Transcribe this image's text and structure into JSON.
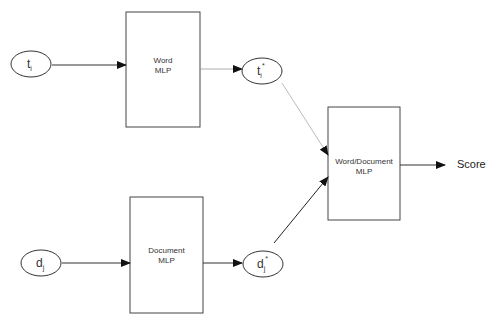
{
  "diagram": {
    "nodes": {
      "t_i": {
        "base": "t",
        "sub": "i",
        "sup": ""
      },
      "t_i_star": {
        "base": "t",
        "sub": "i",
        "sup": "*"
      },
      "d_j": {
        "base": "d",
        "sub": "j",
        "sup": ""
      },
      "d_j_star": {
        "base": "d",
        "sub": "j",
        "sup": "*"
      }
    },
    "boxes": {
      "word_mlp": {
        "line1": "Word",
        "line2": "MLP"
      },
      "document_mlp": {
        "line1": "Document",
        "line2": "MLP"
      },
      "word_document_mlp": {
        "line1": "Word/Document",
        "line2": "MLP"
      }
    },
    "output": {
      "label": "Score"
    },
    "colors": {
      "stroke": "#333333",
      "light_edge": "#9a9a9a",
      "background": "#ffffff"
    }
  }
}
